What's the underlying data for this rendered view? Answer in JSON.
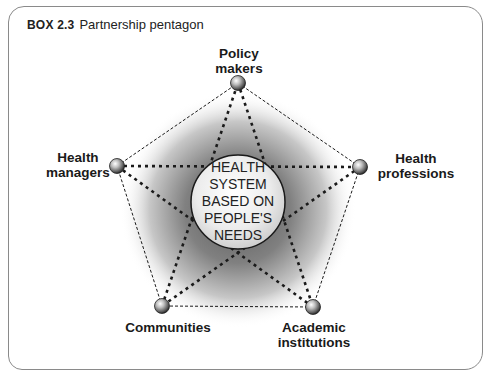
{
  "box": {
    "number": "BOX 2.3",
    "title": "Partnership pentagon"
  },
  "center": {
    "lines": [
      "HEALTH",
      "SYSTEM",
      "BASED ON",
      "PEOPLE'S",
      "NEEDS"
    ]
  },
  "nodes": [
    {
      "id": "policy-makers",
      "lines": [
        "Policy",
        "makers"
      ]
    },
    {
      "id": "health-managers",
      "lines": [
        "Health",
        "managers"
      ]
    },
    {
      "id": "health-professions",
      "lines": [
        "Health",
        "professions"
      ]
    },
    {
      "id": "communities",
      "lines": [
        "Communities"
      ]
    },
    {
      "id": "academic-institutions",
      "lines": [
        "Academic",
        "institutions"
      ]
    }
  ],
  "colors": {
    "border": "#8a8a8a",
    "line": "#1a1a1a",
    "shade": "#555555"
  }
}
